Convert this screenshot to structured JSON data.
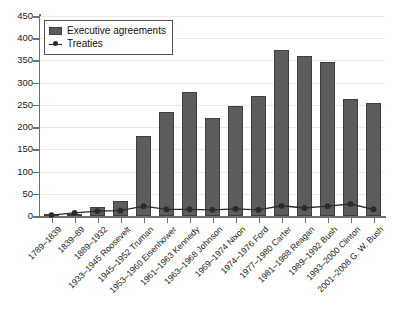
{
  "chart_data": {
    "type": "bar",
    "title": "",
    "subtitle": "",
    "xlabel": "",
    "ylabel": "",
    "ylim": [
      0,
      450
    ],
    "ytick_step": 50,
    "yticks": [
      0,
      50,
      100,
      150,
      200,
      250,
      300,
      350,
      400,
      450
    ],
    "ytick_labels": [
      "0",
      "50",
      "100",
      "150",
      "200",
      "250",
      "300",
      "350",
      "400",
      "450"
    ],
    "grid": true,
    "legend_position": "upper left",
    "categories": [
      "1789–1839",
      "1839–89",
      "1889–1932",
      "1933–1945 Roosevelt",
      "1945–1952 Truman",
      "1953–1960 Eisenhower",
      "1961–1963 Kennedy",
      "1963–1968 Johnson",
      "1969–1974 Nixon",
      "1974–1976 Ford",
      "1977–1980 Carter",
      "1981–1988 Reagan",
      "1989–1992 Bush",
      "1993–2000 Clinton",
      "2001–2008 G. W. Bush"
    ],
    "series": [
      {
        "name": "Executive agreements",
        "kind": "bar",
        "color": "#5c5c5c",
        "values": [
          1,
          5,
          20,
          33,
          180,
          235,
          278,
          221,
          247,
          271,
          373,
          361,
          346,
          264,
          254
        ]
      },
      {
        "name": "Treaties",
        "kind": "line",
        "color": "#2a2a2a",
        "values": [
          2,
          7,
          11,
          12,
          22,
          15,
          15,
          14,
          16,
          14,
          23,
          18,
          22,
          27,
          15
        ]
      }
    ]
  },
  "legend": {
    "entries": [
      {
        "label": "Executive agreements",
        "icon": "bar-swatch-icon"
      },
      {
        "label": "Treaties",
        "icon": "line-marker-icon"
      }
    ]
  }
}
